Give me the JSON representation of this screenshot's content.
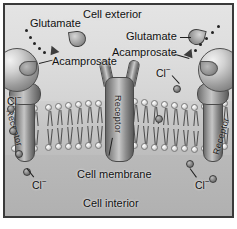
{
  "figure": {
    "background_color": "#d9d9d9",
    "border_color": "#3a3a3a"
  },
  "regions": {
    "exterior_label": "Cell exterior",
    "interior_label": "Cell interior",
    "membrane_label": "Cell membrane"
  },
  "labels": {
    "glutamate_left": "Glutamate",
    "acamprosate_left": "Acamprosate",
    "glutamate_right": "Glutamate",
    "acamprosate_right": "Acamprosate",
    "receptor_left": "Receptor",
    "receptor_center": "Receptor",
    "receptor_right": "Receptor",
    "chloride_exterior_right": "Cl",
    "chloride_interior_left_edge": "Cl",
    "chloride_interior_left": "Cl",
    "chloride_interior_right": "Cl",
    "charge_superscript": "−"
  },
  "colors": {
    "exterior_fill": "#dcdcdc",
    "interior_fill": "#b4b4b4",
    "membrane_fill": "#c6c6c6",
    "receptor_dark": "#5d5d5d",
    "receptor_light": "#c9c9c9",
    "ion_fill": "#8c8c8c",
    "text": "#111111"
  },
  "elements": {
    "receptor_count": 3,
    "bound_receptors": 2,
    "unbound_receptors": 1,
    "chloride_ion_count": 8,
    "glutamate_molecule_count": 2,
    "acamprosate_molecule_count": 2
  }
}
